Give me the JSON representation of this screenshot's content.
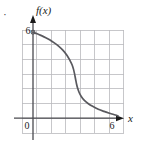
{
  "figure": {
    "kind": "cartesian-plot",
    "background_color": "#ffffff",
    "grid_color": "#b9b9bd",
    "axis_color": "#4a4a4f",
    "curve_color": "#59595e",
    "text_color": "#1a1a1a",
    "bullet_mark": "·"
  },
  "labels": {
    "y_axis": "f(x)",
    "x_axis": "x",
    "origin": "0",
    "x_tick_6": "6",
    "y_tick_6": "6"
  },
  "chart_data": {
    "type": "line",
    "title": "",
    "xlabel": "x",
    "ylabel": "f(x)",
    "xlim": [
      0,
      6
    ],
    "ylim": [
      0,
      6
    ],
    "grid": true,
    "legend": false,
    "xticks": [
      0,
      6
    ],
    "yticks": [
      0,
      6
    ],
    "xtick_labels": [
      "0",
      "6"
    ],
    "ytick_labels": [
      "",
      "6"
    ],
    "series": [
      {
        "name": "f(x)",
        "x": [
          0.0,
          0.3,
          0.6,
          0.9,
          1.2,
          1.5,
          1.8,
          2.1,
          2.4,
          2.6,
          2.75,
          2.85,
          2.93,
          3.0,
          3.07,
          3.15,
          3.25,
          3.4,
          3.6,
          3.9,
          4.2,
          4.6,
          5.0,
          5.4,
          5.8,
          6.0
        ],
        "y": [
          5.95,
          5.85,
          5.72,
          5.58,
          5.42,
          5.22,
          5.0,
          4.72,
          4.35,
          4.0,
          3.7,
          3.4,
          3.05,
          2.7,
          2.35,
          2.05,
          1.78,
          1.5,
          1.25,
          1.0,
          0.82,
          0.62,
          0.47,
          0.34,
          0.22,
          0.15
        ]
      }
    ]
  }
}
